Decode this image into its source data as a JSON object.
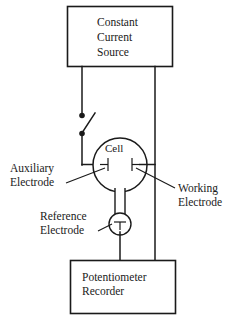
{
  "figure": {
    "type": "schematic-diagram",
    "background_color": "#ffffff",
    "line_color": "#1a1a1a"
  },
  "blocks": {
    "source": {
      "name": "constant-current-source",
      "lines": [
        "Constant",
        "Current",
        "Source"
      ],
      "line1": "Constant",
      "line2": "Current",
      "line3": "Source"
    },
    "recorder": {
      "name": "potentiometer-recorder",
      "lines": [
        "Potentiometer",
        "Recorder"
      ],
      "line1": "Potentiometer",
      "line2": "Recorder"
    }
  },
  "cell": {
    "label": "Cell"
  },
  "callouts": {
    "auxiliary": {
      "line1": "Auxiliary",
      "line2": "Electrode"
    },
    "working": {
      "line1": "Working",
      "line2": "Electrode"
    },
    "reference": {
      "line1": "Reference",
      "line2": "Electrode"
    }
  },
  "components": {
    "switch": {
      "name": "toggle-switch",
      "state": "open"
    }
  }
}
